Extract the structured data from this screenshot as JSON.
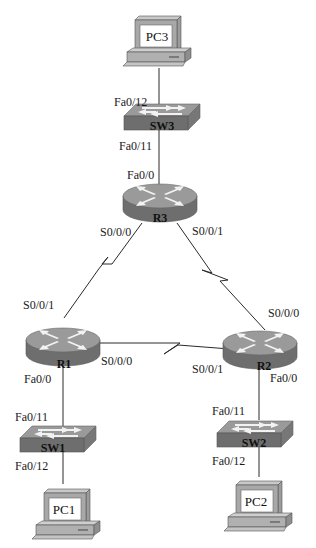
{
  "diagram": {
    "type": "network-topology",
    "colors": {
      "device_top": "#9a9a9a",
      "device_side": "#6e6e6e",
      "device_arrow": "#f2f2f2",
      "pc_screen": "#ffffff",
      "pc_body": "#b0b0b0",
      "link": "#2a2a2a"
    },
    "devices": {
      "pc3": {
        "label": "PC3",
        "type": "pc",
        "icon": "pc-icon"
      },
      "sw3": {
        "label": "SW3",
        "type": "switch",
        "icon": "switch-icon"
      },
      "r3": {
        "label": "R3",
        "type": "router",
        "icon": "router-icon"
      },
      "r1": {
        "label": "R1",
        "type": "router",
        "icon": "router-icon"
      },
      "r2": {
        "label": "R2",
        "type": "router",
        "icon": "router-icon"
      },
      "sw1": {
        "label": "SW1",
        "type": "switch",
        "icon": "switch-icon"
      },
      "sw2": {
        "label": "SW2",
        "type": "switch",
        "icon": "switch-icon"
      },
      "pc1": {
        "label": "PC1",
        "type": "pc",
        "icon": "pc-icon"
      },
      "pc2": {
        "label": "PC2",
        "type": "pc",
        "icon": "pc-icon"
      }
    },
    "ports": {
      "sw3_to_pc3": "Fa0/12",
      "sw3_to_r3": "Fa0/11",
      "r3_to_sw3": "Fa0/0",
      "r3_to_r1": "S0/0/0",
      "r3_to_r2": "S0/0/1",
      "r1_to_r3": "S0/0/1",
      "r1_to_r2": "S0/0/0",
      "r1_to_sw1": "Fa0/0",
      "r2_to_r3": "S0/0/0",
      "r2_to_r1": "S0/0/1",
      "r2_to_sw2": "Fa0/0",
      "sw1_to_r1": "Fa0/11",
      "sw1_to_pc1": "Fa0/12",
      "sw2_to_r2": "Fa0/11",
      "sw2_to_pc2": "Fa0/12"
    },
    "links": [
      {
        "from": "PC3",
        "to": "SW3",
        "kind": "ethernet"
      },
      {
        "from": "SW3",
        "to": "R3",
        "kind": "ethernet"
      },
      {
        "from": "R3",
        "to": "R1",
        "kind": "serial"
      },
      {
        "from": "R3",
        "to": "R2",
        "kind": "serial"
      },
      {
        "from": "R1",
        "to": "R2",
        "kind": "serial"
      },
      {
        "from": "R1",
        "to": "SW1",
        "kind": "ethernet"
      },
      {
        "from": "R2",
        "to": "SW2",
        "kind": "ethernet"
      },
      {
        "from": "SW1",
        "to": "PC1",
        "kind": "ethernet"
      },
      {
        "from": "SW2",
        "to": "PC2",
        "kind": "ethernet"
      }
    ]
  }
}
